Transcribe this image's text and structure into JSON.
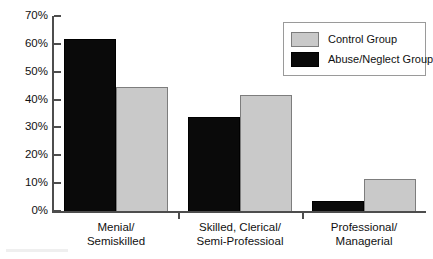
{
  "chart_data": {
    "type": "bar",
    "title": "",
    "xlabel": "",
    "ylabel": "",
    "ylim": [
      0,
      70
    ],
    "grid": false,
    "legend_position": "top-right",
    "categories": [
      "Menial/\nSemiskilled",
      "Skilled, Clerical/\nSemi-Professioal",
      "Professional/\nManagerial"
    ],
    "category_lines": [
      [
        "Menial/",
        "Semiskilled"
      ],
      [
        "Skilled, Clerical/",
        "Semi-Professioal"
      ],
      [
        "Professional/",
        "Managerial"
      ]
    ],
    "series": [
      {
        "name": "Abuse/Neglect Group",
        "color": "#0a0a0a",
        "values": [
          62,
          34,
          4
        ]
      },
      {
        "name": "Control Group",
        "color": "#c9c9c9",
        "values": [
          45,
          42,
          12
        ]
      }
    ],
    "ytick_values": [
      70,
      60,
      50,
      40,
      30,
      20,
      10,
      0
    ],
    "ytick_labels": [
      "70%",
      "60%",
      "50%",
      "40%",
      "30%",
      "20%",
      "10%",
      "0%"
    ]
  },
  "legend": {
    "entries": [
      {
        "label": "Control Group",
        "swatch": "light"
      },
      {
        "label": "Abuse/Neglect Group",
        "swatch": "dark"
      }
    ]
  },
  "colors": {
    "control_group": "#c9c9c9",
    "abuse_neglect_group": "#0a0a0a",
    "axis": "#4d4d4d",
    "text": "#111111",
    "background": "#ffffff"
  }
}
